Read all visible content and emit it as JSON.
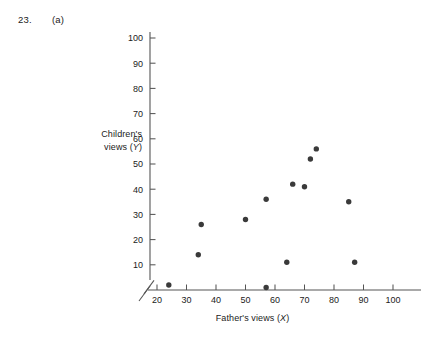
{
  "header": {
    "question_number": "23.",
    "part_label": "(a)"
  },
  "chart_data": {
    "type": "scatter",
    "title": "",
    "xlabel": "Father's views (X)",
    "xlabel_text": "Father's views (",
    "xlabel_var": "X",
    "xlabel_close": ")",
    "ylabel_line1": "Children's",
    "ylabel_line2_text": "views (",
    "ylabel_var": "Y",
    "ylabel_close": ")",
    "ylabel": "Children's views (Y)",
    "xlim": [
      20,
      100
    ],
    "ylim": [
      0,
      100
    ],
    "xticks": [
      20,
      30,
      40,
      50,
      60,
      70,
      80,
      90,
      100
    ],
    "yticks": [
      10,
      20,
      30,
      40,
      50,
      60,
      70,
      80,
      90,
      100
    ],
    "xticklabels": [
      "20",
      "30",
      "40",
      "50",
      "60",
      "70",
      "80",
      "90",
      "100"
    ],
    "yticklabels": [
      "10",
      "20",
      "30",
      "40",
      "50",
      "60",
      "70",
      "80",
      "90",
      "100"
    ],
    "grid": false,
    "legend": false,
    "axis_break_x": true,
    "axis_break_y": true,
    "marker": "filled-circle",
    "marker_color": "#3a3a3a",
    "marker_size": 5.4,
    "axis_color": "#555555",
    "points": [
      {
        "x": 24,
        "y": 2
      },
      {
        "x": 34,
        "y": 14
      },
      {
        "x": 35,
        "y": 26
      },
      {
        "x": 50,
        "y": 28
      },
      {
        "x": 57,
        "y": 36
      },
      {
        "x": 57,
        "y": 1
      },
      {
        "x": 64,
        "y": 11
      },
      {
        "x": 66,
        "y": 42
      },
      {
        "x": 70,
        "y": 41
      },
      {
        "x": 72,
        "y": 52
      },
      {
        "x": 74,
        "y": 56
      },
      {
        "x": 85,
        "y": 35
      },
      {
        "x": 87,
        "y": 11
      }
    ]
  }
}
